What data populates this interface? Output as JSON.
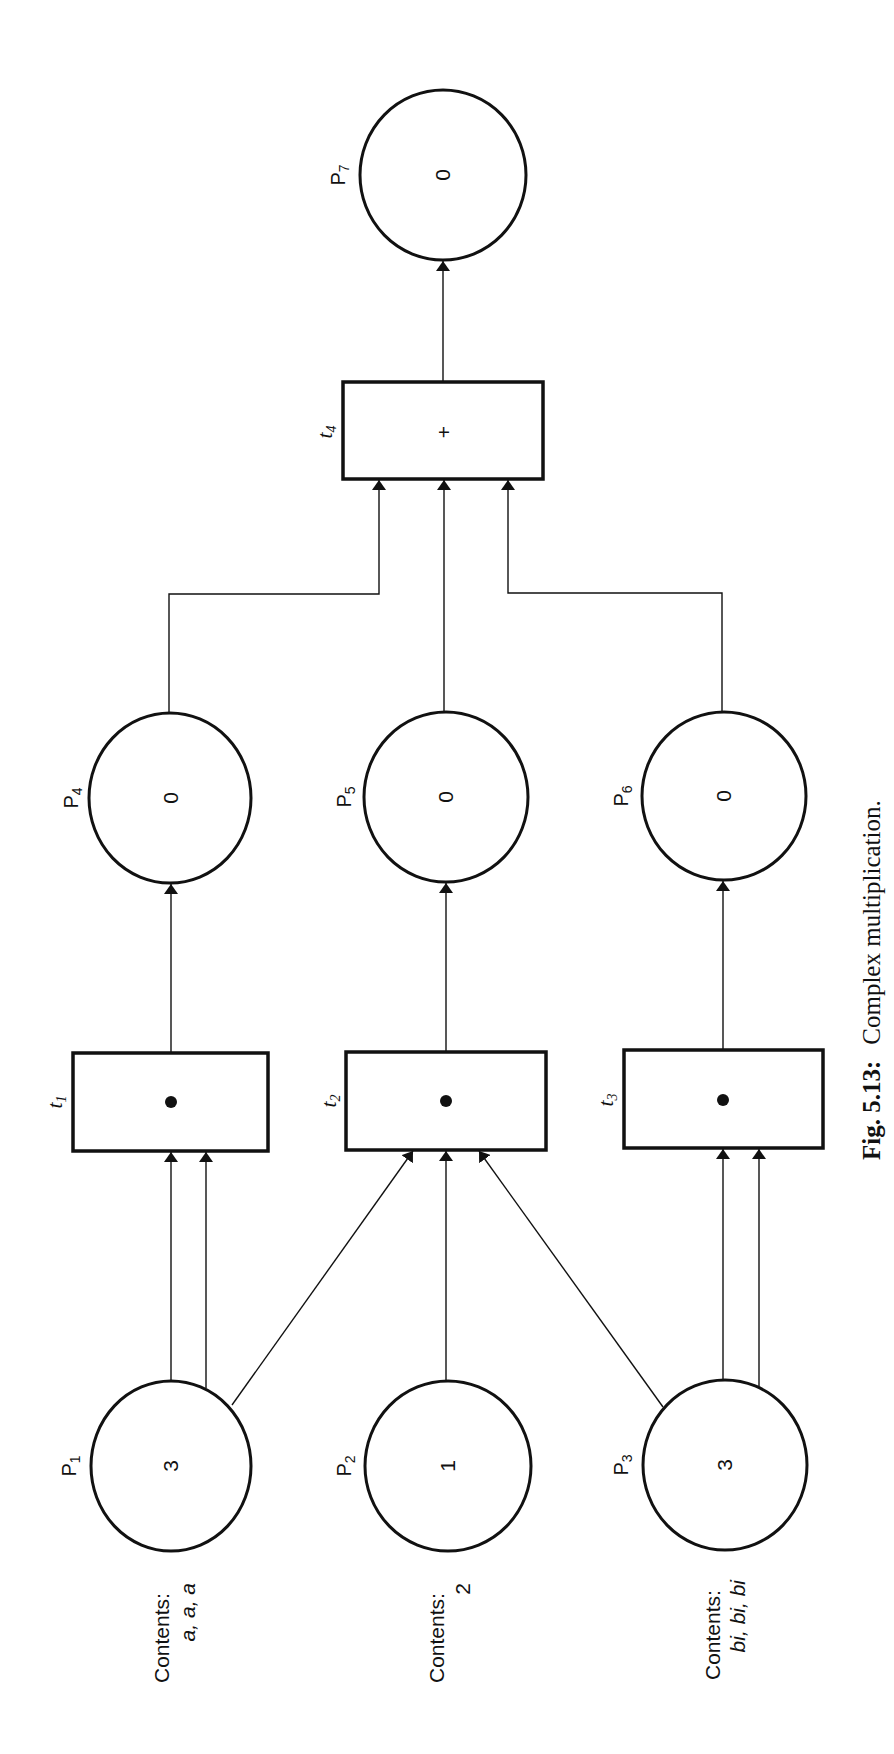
{
  "figure": {
    "caption_label": "Fig. 5.13:",
    "caption_text": "Complex multiplication."
  },
  "places": [
    {
      "id": "P1",
      "name": "P",
      "sub": "1",
      "tokens": "3",
      "contents_label": "Contents:",
      "contents_value": "a, a, a"
    },
    {
      "id": "P2",
      "name": "P",
      "sub": "2",
      "tokens": "1",
      "contents_label": "Contents:",
      "contents_value": "2"
    },
    {
      "id": "P3",
      "name": "P",
      "sub": "3",
      "tokens": "3",
      "contents_label": "Contents:",
      "contents_value": "bi, bi, bi"
    },
    {
      "id": "P4",
      "name": "P",
      "sub": "4",
      "tokens": "0"
    },
    {
      "id": "P5",
      "name": "P",
      "sub": "5",
      "tokens": "0"
    },
    {
      "id": "P6",
      "name": "P",
      "sub": "6",
      "tokens": "0"
    },
    {
      "id": "P7",
      "name": "P",
      "sub": "7",
      "tokens": "0"
    }
  ],
  "transitions": [
    {
      "id": "t1",
      "name": "t",
      "sub": "1",
      "symbol": "•"
    },
    {
      "id": "t2",
      "name": "t",
      "sub": "2",
      "symbol": "•"
    },
    {
      "id": "t3",
      "name": "t",
      "sub": "3",
      "symbol": "•"
    },
    {
      "id": "t4",
      "name": "t",
      "sub": "4",
      "symbol": "+"
    }
  ],
  "arcs": [
    {
      "from": "P1",
      "to": "t1",
      "count": 2
    },
    {
      "from": "P1",
      "to": "t2",
      "count": 1
    },
    {
      "from": "P2",
      "to": "t2",
      "count": 1
    },
    {
      "from": "P3",
      "to": "t2",
      "count": 1
    },
    {
      "from": "P3",
      "to": "t3",
      "count": 2
    },
    {
      "from": "t1",
      "to": "P4",
      "count": 1
    },
    {
      "from": "t2",
      "to": "P5",
      "count": 1
    },
    {
      "from": "t3",
      "to": "P6",
      "count": 1
    },
    {
      "from": "P4",
      "to": "t4",
      "count": 1
    },
    {
      "from": "P5",
      "to": "t4",
      "count": 1
    },
    {
      "from": "P6",
      "to": "t4",
      "count": 1
    },
    {
      "from": "t4",
      "to": "P7",
      "count": 1
    }
  ]
}
